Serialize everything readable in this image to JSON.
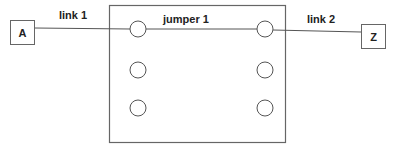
{
  "diagram": {
    "nodes": [
      {
        "id": "A",
        "label": "A"
      },
      {
        "id": "Z",
        "label": "Z"
      }
    ],
    "panel": {
      "label": "jumper 1",
      "ports": [
        {
          "row": 1,
          "col": "left"
        },
        {
          "row": 1,
          "col": "right"
        },
        {
          "row": 2,
          "col": "left"
        },
        {
          "row": 2,
          "col": "right"
        },
        {
          "row": 3,
          "col": "left"
        },
        {
          "row": 3,
          "col": "right"
        }
      ]
    },
    "links": [
      {
        "label": "link 1",
        "from": "A",
        "to": "port-1-left"
      },
      {
        "label": "jumper 1",
        "from": "port-1-left",
        "to": "port-1-right"
      },
      {
        "label": "link 2",
        "from": "port-1-right",
        "to": "Z"
      }
    ],
    "colors": {
      "stroke": "#555555",
      "text": "#222222",
      "background": "#ffffff"
    }
  }
}
